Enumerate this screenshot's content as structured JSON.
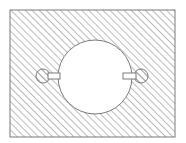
{
  "diagram": {
    "type": "hatched-section-view",
    "colors": {
      "stroke": "#7a7a7a",
      "hatch": "#9a9a9a",
      "background": "#ffffff"
    },
    "plate": {
      "x": 10,
      "y": 10,
      "width": 165,
      "height": 127
    },
    "central_hole": {
      "cx": 95,
      "cy": 77,
      "r": 37
    },
    "keyholes": [
      {
        "side": "left",
        "cx": 43,
        "cy": 76,
        "r": 7,
        "tab": {
          "x": 48,
          "y": 73,
          "width": 12,
          "height": 6
        }
      },
      {
        "side": "right",
        "cx": 141,
        "cy": 76,
        "r": 7,
        "tab": {
          "x": 123,
          "y": 73,
          "width": 13,
          "height": 6
        }
      }
    ]
  }
}
